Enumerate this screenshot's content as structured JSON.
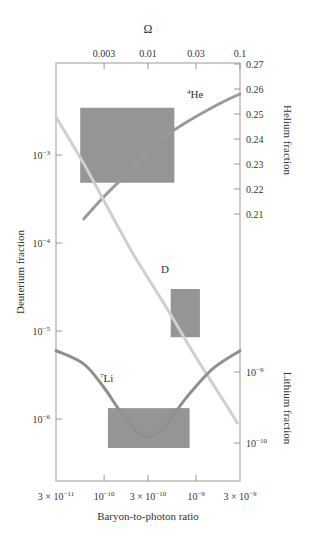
{
  "chart_data": {
    "type": "line",
    "title": "",
    "xlabel": "Baryon-to-photon ratio",
    "x_scale": "log",
    "x_ticks": [
      {
        "value": 3e-11,
        "label": "3 × 10",
        "exp": "−11"
      },
      {
        "value": 1e-10,
        "label": "10",
        "exp": "−10"
      },
      {
        "value": 3e-10,
        "label": "3 × 10",
        "exp": "−10"
      },
      {
        "value": 1e-09,
        "label": "10",
        "exp": "−9"
      },
      {
        "value": 3e-09,
        "label": "3 × 10",
        "exp": "−9"
      }
    ],
    "xlim": [
      3e-11,
      3e-09
    ],
    "top_axis": {
      "label": "Ω",
      "ticks": [
        "0.003",
        "0.01",
        "0.03",
        "0.1"
      ]
    },
    "left_axis": {
      "label": "Deuterium fraction",
      "scale": "log",
      "ticks": [
        {
          "value": 0.001,
          "label": "10",
          "exp": "−3"
        },
        {
          "value": 0.0001,
          "label": "10",
          "exp": "−4"
        },
        {
          "value": 1e-05,
          "label": "10",
          "exp": "−5"
        },
        {
          "value": 1e-06,
          "label": "10",
          "exp": "−6"
        }
      ]
    },
    "right_axis_helium": {
      "label": "Helium fraction",
      "scale": "linear",
      "ticks": [
        "0.27",
        "0.26",
        "0.25",
        "0.24",
        "0.23",
        "0.22",
        "0.21"
      ],
      "ylim": [
        0.21,
        0.27
      ]
    },
    "right_axis_lithium": {
      "label": "Lithium fraction",
      "scale": "log",
      "ticks": [
        {
          "value": 1e-09,
          "label": "10",
          "exp": "−9"
        },
        {
          "value": 1e-10,
          "label": "10",
          "exp": "−10"
        }
      ]
    },
    "series": [
      {
        "name": "4He",
        "label_sup": "4",
        "label_main": "He",
        "axis": "helium",
        "color": "#9a9a9a",
        "x": [
          6e-11,
          1e-10,
          2e-10,
          3e-10,
          5e-10,
          1e-09,
          2e-09,
          3e-09
        ],
        "y": [
          0.208,
          0.217,
          0.228,
          0.235,
          0.242,
          0.249,
          0.255,
          0.258
        ]
      },
      {
        "name": "D",
        "label_main": "D",
        "axis": "deuterium",
        "color": "#cfcfcf",
        "x": [
          3e-11,
          6e-11,
          1e-10,
          2e-10,
          3e-10,
          5e-10,
          1e-09,
          2e-09,
          2.8e-09
        ],
        "y": [
          0.0027,
          0.0008,
          0.0003,
          8e-05,
          4e-05,
          1.7e-05,
          5e-06,
          1.6e-06,
          9e-07
        ]
      },
      {
        "name": "7Li",
        "label_sup": "7",
        "label_main": "Li",
        "axis": "lithium",
        "color": "#8f8f8f",
        "x": [
          3e-11,
          6e-11,
          1e-10,
          1.5e-10,
          2.5e-10,
          3.5e-10,
          5e-10,
          8e-10,
          1.5e-09,
          3e-09
        ],
        "y": [
          2e-09,
          1.3e-09,
          6e-10,
          2.8e-10,
          1.3e-10,
          1.3e-10,
          2e-10,
          4.5e-10,
          1.1e-09,
          2e-09
        ]
      }
    ],
    "observed_boxes": [
      {
        "name": "helium-box",
        "x_range": [
          5.5e-11,
          5.8e-10
        ],
        "y_range": [
          0.2225,
          0.2525
        ],
        "axis": "helium",
        "color": "#8a8a8a"
      },
      {
        "name": "deuterium-box",
        "x_range": [
          5.3e-10,
          1.1e-09
        ],
        "y_range": [
          8.5e-06,
          3e-05
        ],
        "axis": "deuterium",
        "color": "#8a8a8a"
      },
      {
        "name": "lithium-box",
        "x_range": [
          1.1e-10,
          8.5e-10
        ],
        "y_range": [
          8.5e-11,
          3.1e-10
        ],
        "axis": "lithium",
        "color": "#8a8a8a"
      }
    ],
    "grid": false,
    "legend": "inline labels"
  }
}
